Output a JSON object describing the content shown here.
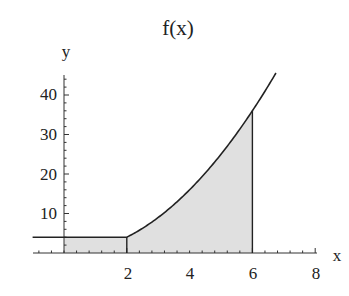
{
  "chart_data": {
    "type": "area",
    "title": "f(x)",
    "xlabel": "x",
    "ylabel": "y",
    "xlim": [
      -1,
      8
    ],
    "ylim": [
      0,
      45
    ],
    "x_ticks": [
      2,
      4,
      6,
      8
    ],
    "y_ticks": [
      10,
      20,
      30,
      40
    ],
    "grid": false,
    "legend": null,
    "function": "f(x) = 4 for x <= 2; f(x) = x^2 for x > 2",
    "series": [
      {
        "name": "f(x)",
        "x": [
          -1,
          0,
          2,
          3,
          4,
          5,
          6,
          6.75
        ],
        "y": [
          4,
          4,
          4,
          9,
          16,
          25,
          36,
          45.5
        ]
      }
    ],
    "shaded_region": {
      "x_from": 0,
      "x_to": 6,
      "color": "#e0e0e0"
    },
    "annotations": [
      {
        "type": "vertical-line",
        "x": 2,
        "from": 0,
        "to": 4
      },
      {
        "type": "vertical-line",
        "x": 6,
        "from": 0,
        "to": 36
      }
    ]
  },
  "labels": {
    "title": "f(x)",
    "xlabel": "x",
    "ylabel": "y",
    "xticks": [
      "2",
      "4",
      "6",
      "8"
    ],
    "yticks": [
      "10",
      "20",
      "30",
      "40"
    ]
  }
}
